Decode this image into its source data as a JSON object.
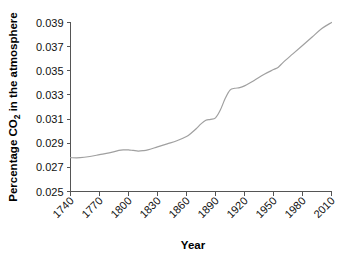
{
  "chart_data": {
    "type": "line",
    "title": "",
    "xlabel": "Year",
    "ylabel": "Percentage CO2 in the atmosphere",
    "ylabel_prefix": "Percentage CO",
    "ylabel_subscript": "2",
    "ylabel_suffix": " in the atmosphere",
    "xlim": [
      1740,
      2010
    ],
    "ylim": [
      0.025,
      0.039
    ],
    "grid": false,
    "legend": false,
    "line_color": "#a0a0a0",
    "axis_color": "#555555",
    "background_color": "#ffffff",
    "x_ticks": [
      1740,
      1770,
      1800,
      1830,
      1860,
      1890,
      1920,
      1950,
      1980,
      2010
    ],
    "x_tick_labels": [
      "1740",
      "1770",
      "1800",
      "1830",
      "1860",
      "1890",
      "1920",
      "1950",
      "1980",
      "2010"
    ],
    "y_ticks": [
      0.025,
      0.027,
      0.029,
      0.031,
      0.033,
      0.035,
      0.037,
      0.039
    ],
    "y_tick_labels": [
      "0.025",
      "0.027",
      "0.029",
      "0.031",
      "0.033",
      "0.035",
      "0.037",
      "0.039"
    ],
    "series": [
      {
        "name": "Percentage CO2 in the atmosphere",
        "x": [
          1740,
          1750,
          1760,
          1770,
          1780,
          1790,
          1795,
          1800,
          1805,
          1810,
          1815,
          1820,
          1830,
          1840,
          1850,
          1860,
          1865,
          1870,
          1875,
          1880,
          1885,
          1890,
          1895,
          1900,
          1905,
          1910,
          1915,
          1920,
          1930,
          1940,
          1950,
          1955,
          1960,
          1970,
          1980,
          1990,
          2000,
          2010
        ],
        "y": [
          0.0278,
          0.0278,
          0.0279,
          0.02805,
          0.0282,
          0.0284,
          0.02845,
          0.02845,
          0.0284,
          0.02835,
          0.02838,
          0.02845,
          0.0287,
          0.02895,
          0.0292,
          0.02955,
          0.02985,
          0.0302,
          0.0306,
          0.0309,
          0.03098,
          0.0311,
          0.03175,
          0.0327,
          0.0334,
          0.03355,
          0.0336,
          0.03375,
          0.0342,
          0.0347,
          0.0351,
          0.0353,
          0.0357,
          0.0364,
          0.0371,
          0.0378,
          0.0385,
          0.039
        ]
      }
    ]
  }
}
